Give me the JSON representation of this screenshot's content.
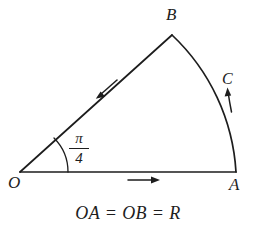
{
  "figure": {
    "type": "circular-sector-diagram",
    "background_color": "#ffffff",
    "stroke_color": "#1d1d1d",
    "caption": "OA = OB = R",
    "vertices": {
      "O": {
        "label": "O",
        "x": 20,
        "y": 172
      },
      "A": {
        "label": "A",
        "x": 236,
        "y": 172
      },
      "B": {
        "label": "B",
        "x": 172,
        "y": 35
      },
      "C": {
        "label": "C",
        "x": 228,
        "y": 86
      }
    },
    "angle": {
      "numerator": "π",
      "denominator": "4",
      "value_label": "π/4",
      "at_vertex": "O",
      "arc_radius": 48
    },
    "edges": [
      {
        "name": "OA",
        "from": "O",
        "to": "A",
        "kind": "straight",
        "arrow_direction": "right"
      },
      {
        "name": "OB",
        "from": "O",
        "to": "B",
        "kind": "straight",
        "arrow_direction": "toward-O"
      },
      {
        "name": "arc-AB",
        "from": "A",
        "to": "B",
        "kind": "arc",
        "arrow_direction": "upward-along-arc"
      }
    ]
  }
}
